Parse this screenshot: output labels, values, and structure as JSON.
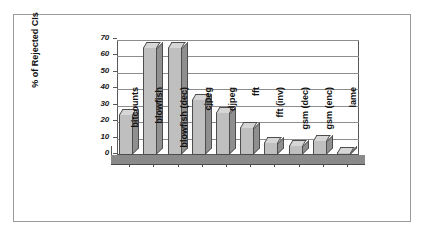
{
  "chart_data": {
    "type": "bar",
    "title": "",
    "xlabel": "",
    "ylabel": "% of Rejected CIs",
    "categories": [
      "bitcounts",
      "blowfish",
      "blowfish (dec)",
      "cjpeg",
      "djpeg",
      "fft",
      "fft (inv)",
      "gsm (dec)",
      "gsm (enc)",
      "lame"
    ],
    "values": [
      25,
      66,
      66,
      34,
      26,
      17,
      8,
      6,
      9,
      2
    ],
    "ylim": [
      0,
      70
    ],
    "yticks": [
      0,
      10,
      20,
      30,
      40,
      50,
      60,
      70
    ],
    "ytick_labels": [
      "0",
      "10",
      "20",
      "30",
      "40",
      "50",
      "60",
      "70"
    ],
    "grid": true,
    "legend": "none",
    "style": "3d-column"
  },
  "colors": {
    "bar_face": "#bfbfbf",
    "bar_top": "#d6d6d6",
    "bar_side": "#8f8f8f",
    "bar_outline": "#4d4d4d",
    "gridline": "#8d8d8d",
    "axis": "#585858",
    "floor": "#8a8a8a",
    "frame": "#9a9a9a",
    "text": "#101010",
    "background": "#ffffff"
  }
}
